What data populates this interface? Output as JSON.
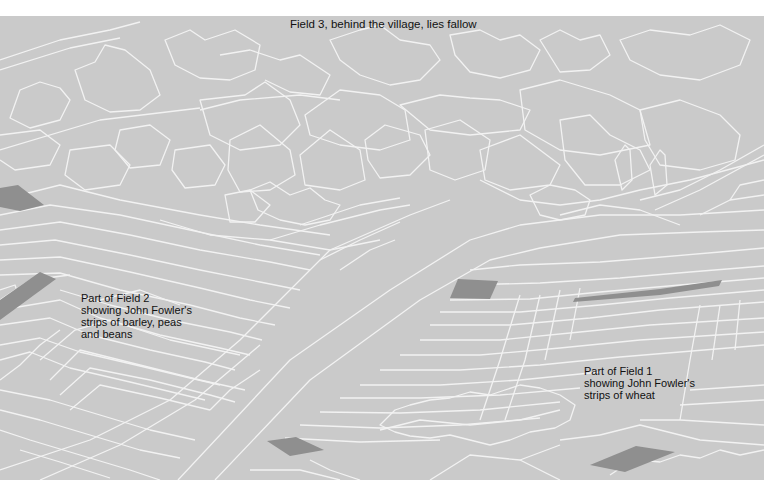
{
  "illustration": {
    "background_color": "#cacaca",
    "line_color": "#f2f2f2",
    "highlight_strip_color": "#8f8f8f",
    "page_background": "#ffffff"
  },
  "labels": {
    "field3": "Field 3, behind the village, lies fallow",
    "field2": {
      "lines": [
        "Part of Field 2",
        "showing John Fowler's",
        "strips of barley, peas",
        "and beans"
      ]
    },
    "field1": {
      "lines": [
        "Part of Field 1",
        "showing John Fowler's",
        "strips of wheat"
      ]
    }
  }
}
